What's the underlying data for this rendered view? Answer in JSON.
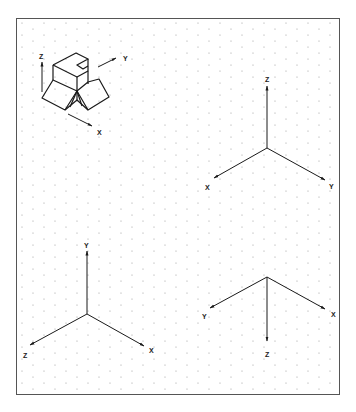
{
  "figure": {
    "frame": {
      "x": 16,
      "y": 18,
      "width": 324,
      "height": 377,
      "stroke": "#555555"
    },
    "grid": {
      "type": "isometric-dots",
      "dx": 11,
      "dy": 12,
      "color": "#9a9a9a"
    },
    "ink": "#1a1a1a"
  },
  "object_view": {
    "name": "isometric-block",
    "axis_labels": {
      "z": "Z",
      "y": "Y",
      "x": "X"
    }
  },
  "axis_sets": [
    {
      "name": "axes-top-right",
      "labels": {
        "z": "Z",
        "x": "X",
        "y": "Y"
      }
    },
    {
      "name": "axes-bottom-left",
      "labels": {
        "y": "Y",
        "z": "Z",
        "x": "X"
      }
    },
    {
      "name": "axes-bottom-right",
      "labels": {
        "y": "Y",
        "x": "X",
        "z": "Z"
      }
    }
  ]
}
